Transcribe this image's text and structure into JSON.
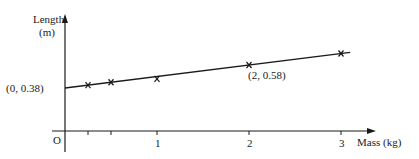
{
  "chart_data": {
    "type": "line",
    "title": "",
    "xlabel": "Mass (kg)",
    "ylabel": "Length (m)",
    "ylabel_line1": "Length",
    "ylabel_line2": "(m)",
    "origin_label": "O",
    "x_ticks": [
      0.25,
      0.5,
      1,
      2,
      3
    ],
    "x_tick_labels": [
      "",
      "",
      "1",
      "2",
      "3"
    ],
    "xlim": [
      0,
      3.3
    ],
    "grid": false,
    "series": [
      {
        "name": "measurements",
        "marker": "x",
        "x": [
          0.25,
          0.5,
          1,
          2,
          3
        ],
        "y": [
          0.405,
          0.43,
          0.46,
          0.58,
          0.68
        ]
      },
      {
        "name": "best-fit line",
        "marker": "none",
        "x": [
          0,
          3.1
        ],
        "y": [
          0.38,
          0.69
        ]
      }
    ],
    "annotations": [
      {
        "text": "(0, 0.38)",
        "x": 0,
        "y": 0.38
      },
      {
        "text": "(2, 0.58)",
        "x": 2,
        "y": 0.58
      }
    ]
  }
}
